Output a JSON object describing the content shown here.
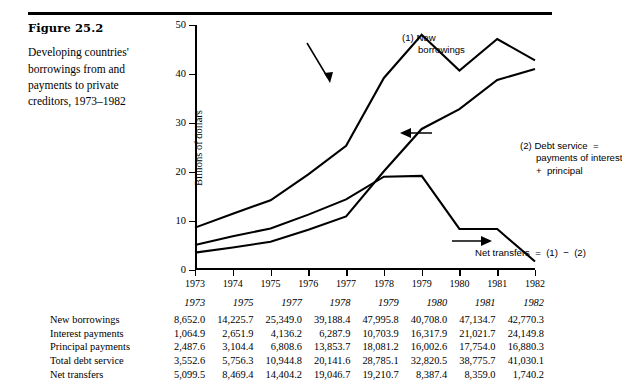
{
  "caption": {
    "figure_number": "Figure 25.2",
    "description": "Developing countries' borrowings from and payments to private creditors, 1973–1982"
  },
  "annotations": {
    "new_borrowings": "(1) New\n      borrowings",
    "debt_service": "(2) Debt service  =\n      payments of interest\n      +  principal",
    "net_transfers": "Net transfers  =  (1)  −  (2)"
  },
  "chart_data": {
    "type": "line",
    "title": "",
    "xlabel": "",
    "ylabel": "Billions of dollars",
    "xlim": [
      1973,
      1982
    ],
    "ylim": [
      0,
      50
    ],
    "yticks": [
      0,
      10,
      20,
      30,
      40,
      50
    ],
    "xticks": [
      1973,
      1974,
      1975,
      1976,
      1977,
      1978,
      1979,
      1980,
      1981,
      1982
    ],
    "grid": false,
    "legend": "annotations-inline",
    "x": [
      1973,
      1974,
      1975,
      1976,
      1977,
      1978,
      1979,
      1980,
      1981,
      1982
    ],
    "series": [
      {
        "name": "(1) New borrowings",
        "values": [
          8.652,
          11.5,
          14.226,
          19.5,
          25.349,
          39.188,
          47.996,
          40.708,
          47.135,
          42.77
        ]
      },
      {
        "name": "(2) Debt service = payments of interest + principal",
        "values": [
          3.553,
          4.6,
          5.756,
          8.2,
          10.945,
          20.142,
          28.785,
          32.821,
          38.776,
          41.03
        ]
      },
      {
        "name": "Net transfers = (1) − (2)",
        "values": [
          5.1,
          6.9,
          8.469,
          11.3,
          14.404,
          19.047,
          19.211,
          8.387,
          8.359,
          1.74
        ]
      }
    ]
  },
  "table": {
    "corner_label": "",
    "columns": [
      "1973",
      "1975",
      "1977",
      "1978",
      "1979",
      "1980",
      "1981",
      "1982"
    ],
    "rows": [
      {
        "label": "New borrowings",
        "values": [
          "8,652.0",
          "14,225.7",
          "25,349.0",
          "39,188.4",
          "47,995.8",
          "40,708.0",
          "47,134.7",
          "42,770.3"
        ]
      },
      {
        "label": "Interest payments",
        "values": [
          "1,064.9",
          "2,651.9",
          "4,136.2",
          "6,287.9",
          "10,703.9",
          "16,317.9",
          "21,021.7",
          "24,149.8"
        ]
      },
      {
        "label": "Principal payments",
        "values": [
          "2,487.6",
          "3,104.4",
          "6,808.6",
          "13,853.7",
          "18,081.2",
          "16,002.6",
          "17,754.0",
          "16,880.3"
        ]
      },
      {
        "label": "Total debt service",
        "values": [
          "3,552.6",
          "5,756.3",
          "10,944.8",
          "20,141.6",
          "28,785.1",
          "32,820.5",
          "38,775.7",
          "41,030.1"
        ]
      },
      {
        "label": "Net transfers",
        "values": [
          "5,099.5",
          "8,469.4",
          "14,404.2",
          "19,046.7",
          "19,210.7",
          "8,387.4",
          "8,359.0",
          "1,740.2"
        ]
      }
    ]
  }
}
